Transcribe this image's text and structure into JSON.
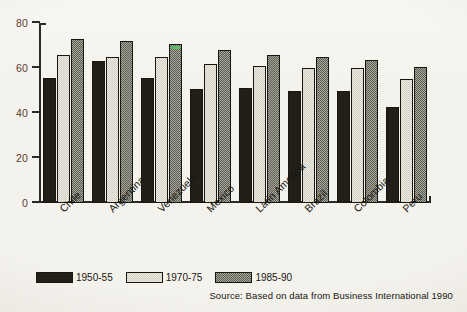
{
  "chart_data": {
    "type": "bar",
    "title": "",
    "subtitle": "",
    "xlabel": "",
    "ylabel": "",
    "ylim": [
      0,
      80
    ],
    "yticks": [
      0,
      20,
      40,
      60,
      80
    ],
    "grid": false,
    "legend_position": "bottom-left",
    "categories": [
      "Chile",
      "Argentina",
      "Venezuela",
      "Mexico",
      "Latin America",
      "Brazil",
      "Colombia",
      "Peru"
    ],
    "series": [
      {
        "name": "1950-55",
        "color": "#231f18",
        "values": [
          55.5,
          63,
          55.5,
          50.5,
          51,
          50,
          50,
          42.5
        ]
      },
      {
        "name": "1970-75",
        "color": "#e8e6dc",
        "values": [
          66,
          65,
          65,
          62,
          61,
          60,
          60,
          55
        ]
      },
      {
        "name": "1985-90",
        "color": "#8d8c80",
        "values": [
          73,
          72,
          70.5,
          68,
          66,
          65,
          63.5,
          60.5
        ]
      }
    ],
    "annotations": [
      {
        "type": "highlight-mark",
        "category": "Venezuela",
        "series": "1985-90",
        "color": "#56c46a"
      }
    ],
    "source": "Source: Based on data from Business International 1990"
  },
  "legend": {
    "items": [
      {
        "label": "1950-55"
      },
      {
        "label": "1970-75"
      },
      {
        "label": "1985-90"
      }
    ]
  },
  "axis": {
    "y_tick_labels": [
      "0",
      "20",
      "40",
      "60",
      "80"
    ],
    "y_tick_color": "#5a3a30"
  }
}
